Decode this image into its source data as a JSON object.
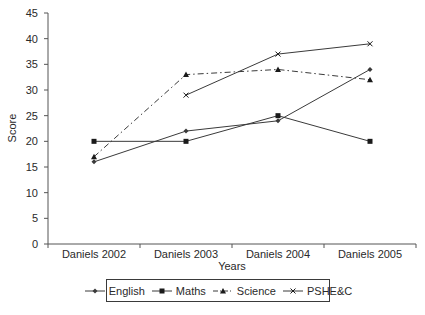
{
  "chart_data": {
    "type": "line",
    "title": "",
    "xlabel": "Years",
    "ylabel": "Score",
    "categories": [
      "Daniels 2002",
      "Daniels 2003",
      "Daniels 2004",
      "Daniels 2005"
    ],
    "ylim": [
      0,
      45
    ],
    "yticks": [
      0,
      5,
      10,
      15,
      20,
      25,
      30,
      35,
      40,
      45
    ],
    "grid": false,
    "legend_position": "bottom",
    "series": [
      {
        "name": "English",
        "values": [
          16,
          22,
          24,
          34
        ],
        "marker": "diamond",
        "line": "solid"
      },
      {
        "name": "Maths",
        "values": [
          20,
          20,
          25,
          20
        ],
        "marker": "square",
        "line": "solid"
      },
      {
        "name": "Science",
        "values": [
          17,
          33,
          34,
          32
        ],
        "marker": "triangle",
        "line": "dashdot"
      },
      {
        "name": "PSHE&C",
        "values": [
          null,
          29,
          37,
          39
        ],
        "marker": "x",
        "line": "solid"
      }
    ]
  },
  "legend": {
    "items": [
      "English",
      "Maths",
      "Science",
      "PSHE&C"
    ]
  },
  "colors": {
    "line": "#3a3a3a",
    "axis": "#555555",
    "text": "#2a2a2a"
  }
}
